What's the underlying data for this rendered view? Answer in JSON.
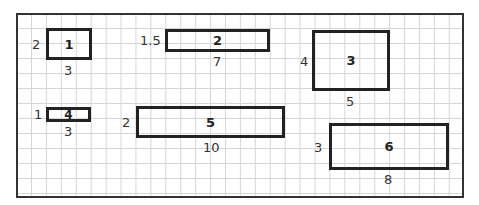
{
  "diagram": {
    "type": "rectangles on grid paper",
    "rectangles": [
      {
        "id": "1",
        "height_label": "2",
        "width_label": "3"
      },
      {
        "id": "2",
        "height_label": "1.5",
        "width_label": "7"
      },
      {
        "id": "3",
        "height_label": "4",
        "width_label": "5"
      },
      {
        "id": "4",
        "height_label": "1",
        "width_label": "3"
      },
      {
        "id": "5",
        "height_label": "2",
        "width_label": "10"
      },
      {
        "id": "6",
        "height_label": "3",
        "width_label": "8"
      }
    ]
  }
}
